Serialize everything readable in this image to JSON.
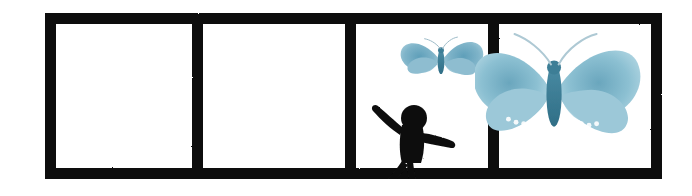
{
  "image": {
    "kind": "comic-strip",
    "title": "Four-panel comic strip with butterflies and a child",
    "width": 692,
    "height": 196,
    "background_color": "#ffffff"
  },
  "frame": {
    "border_color": "#111111",
    "border_thickness_px": 11,
    "outer": {
      "x": 45,
      "y": 13,
      "width": 617,
      "height": 166
    },
    "panel_count": 4,
    "divider_positions_px": [
      192,
      345,
      488
    ]
  },
  "panels": [
    {
      "index": 1,
      "name": "panel-one",
      "label": "Panel 1",
      "content": "empty",
      "items": []
    },
    {
      "index": 2,
      "name": "panel-two",
      "label": "Panel 2",
      "content": "empty",
      "items": []
    },
    {
      "index": 3,
      "name": "panel-three",
      "label": "Panel 3",
      "content": "child reaching toward a small butterfly",
      "items": [
        {
          "name": "small-butterfly",
          "label": "Small blue butterfly",
          "style": "blue halftone illustration",
          "color": "#7fb4c9"
        },
        {
          "name": "child-figure",
          "label": "Black silhouette of a child with arms outstretched",
          "style": "solid black silhouette",
          "color": "#111111"
        }
      ]
    },
    {
      "index": 4,
      "name": "panel-four",
      "label": "Panel 4",
      "content": "large butterfly close-up overlapping the panel border",
      "items": [
        {
          "name": "large-butterfly",
          "label": "Large blue butterfly",
          "style": "blue halftone illustration",
          "color": "#84bace"
        }
      ]
    }
  ],
  "colors": {
    "ink": "#111111",
    "paper": "#ffffff",
    "butterfly_light": "#b7d8e4",
    "butterfly_mid": "#84bace",
    "butterfly_dark": "#4e8fa8",
    "butterfly_body": "#3d7e96"
  }
}
